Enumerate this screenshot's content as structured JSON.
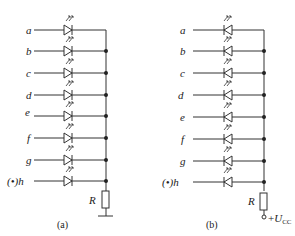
{
  "diagram": {
    "type": "seven-segment LED display internal circuit",
    "panels": [
      {
        "id": "a",
        "caption": "(a)",
        "configuration": "common cathode",
        "inputs": [
          "a",
          "b",
          "c",
          "d",
          "e",
          "f",
          "g",
          "(•)h"
        ],
        "resistor_label": "R",
        "terminal": "ground"
      },
      {
        "id": "b",
        "caption": "(b)",
        "configuration": "common anode",
        "inputs": [
          "a",
          "b",
          "c",
          "d",
          "e",
          "f",
          "g",
          "(•)h"
        ],
        "resistor_label": "R",
        "terminal_label": "+U",
        "terminal_subscript": "CC"
      }
    ]
  }
}
